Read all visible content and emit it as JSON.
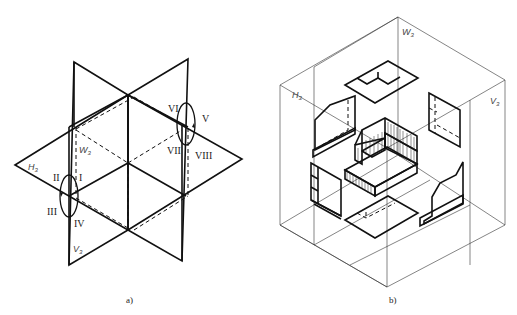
{
  "figure_a": {
    "caption": "a)",
    "plane_labels": {
      "h": {
        "main": "H",
        "sub": "3"
      },
      "w": {
        "main": "W",
        "sub": "3"
      },
      "v": {
        "main": "V",
        "sub": "3"
      }
    },
    "octant_labels": {
      "i": "I",
      "ii": "II",
      "iii": "III",
      "iv": "IV",
      "v": "V",
      "vi": "VI",
      "vii": "VII",
      "viii": "VIII"
    }
  },
  "figure_b": {
    "caption": "b)",
    "plane_labels": {
      "h": {
        "main": "H",
        "sub": "3"
      },
      "w": {
        "main": "W",
        "sub": "3"
      },
      "v": {
        "main": "V",
        "sub": "3"
      }
    }
  },
  "colors": {
    "line": "#111111",
    "thin_line": "#333333",
    "background": "#ffffff"
  }
}
